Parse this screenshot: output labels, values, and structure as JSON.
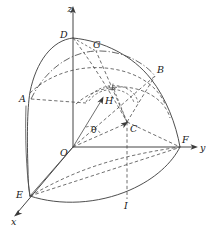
{
  "figure": {
    "kind": "geometry-diagram",
    "width": 215,
    "height": 231,
    "background_color": "#ffffff",
    "line_color": "#3a3a3a",
    "label_color": "#202020"
  },
  "axes": [
    {
      "id": "x",
      "label": "x",
      "label_x": 13,
      "label_y": 223,
      "from": [
        73,
        147
      ],
      "to": [
        16,
        214
      ],
      "style": "solid-arrow"
    },
    {
      "id": "y",
      "label": "y",
      "label_x": 200,
      "label_y": 150,
      "from": [
        73,
        147
      ],
      "to": [
        196,
        147
      ],
      "style": "solid-arrow"
    },
    {
      "id": "z",
      "label": "z",
      "label_x": 70,
      "label_y": 12,
      "from": [
        73,
        147
      ],
      "to": [
        73,
        8
      ],
      "style": "solid-arrow"
    }
  ],
  "points": [
    {
      "id": "A",
      "label": "A",
      "x": 31,
      "y": 99,
      "label_x": 20,
      "label_y": 101
    },
    {
      "id": "B",
      "label": "B",
      "x": 155,
      "y": 76,
      "label_x": 157,
      "label_y": 73
    },
    {
      "id": "C",
      "label": "C",
      "x": 127,
      "y": 122,
      "label_x": 130,
      "label_y": 132
    },
    {
      "id": "D",
      "label": "D",
      "x": 73,
      "y": 38,
      "label_x": 62,
      "label_y": 37
    },
    {
      "id": "E",
      "label": "E",
      "x": 30,
      "y": 196,
      "label_x": 17,
      "label_y": 196
    },
    {
      "id": "F",
      "label": "F",
      "x": 180,
      "y": 147,
      "label_x": 182,
      "label_y": 143
    },
    {
      "id": "G",
      "label": "G",
      "x": 96,
      "y": 51,
      "label_x": 95,
      "label_y": 49
    },
    {
      "id": "H",
      "label": "H",
      "x": 103,
      "y": 98,
      "label_x": 105,
      "label_y": 103
    },
    {
      "id": "I",
      "label": "I",
      "x": 127,
      "y": 199,
      "label_x": 125,
      "label_y": 207
    }
  ],
  "angles": [
    {
      "id": "theta",
      "label": "θ",
      "label_x": 92,
      "label_y": 130,
      "vertex": "O",
      "between": [
        "OH",
        "OC"
      ]
    }
  ],
  "origin": {
    "id": "O",
    "label": "O",
    "x": 73,
    "y": 147,
    "label_x": 62,
    "label_y": 155
  },
  "markers": [
    {
      "id": "right-angle",
      "label": "",
      "x": 113,
      "y": 87,
      "note": "right angle square at arc intersection"
    }
  ],
  "legend": {
    "solid": "sphere outline / axes",
    "dashed": "hidden edges and radial lines",
    "dashdot": "meridian arc through G"
  }
}
